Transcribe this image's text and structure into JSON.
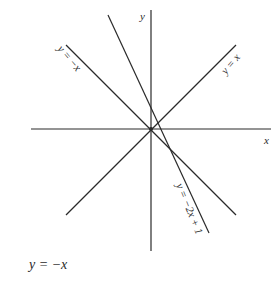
{
  "diagram": {
    "axes": {
      "x_label": "x",
      "y_label": "y",
      "origin_px": [
        151,
        129
      ],
      "x_axis_px": [
        31,
        271
      ],
      "y_axis_px": [
        10,
        251
      ]
    },
    "lines": [
      {
        "id": "y-eq-x",
        "label": "y = x",
        "from": [
          66,
          215
        ],
        "to": [
          236,
          45
        ]
      },
      {
        "id": "y-eq-neg-x",
        "label": "y = −x",
        "from": [
          66,
          45
        ],
        "to": [
          236,
          215
        ]
      },
      {
        "id": "y-eq-neg2x-plus1",
        "label": "y = −2x + 1",
        "from": [
          108,
          15
        ],
        "to": [
          209,
          233
        ]
      }
    ],
    "stroke_color": "#2a2a2a"
  },
  "caption": "y = −x"
}
